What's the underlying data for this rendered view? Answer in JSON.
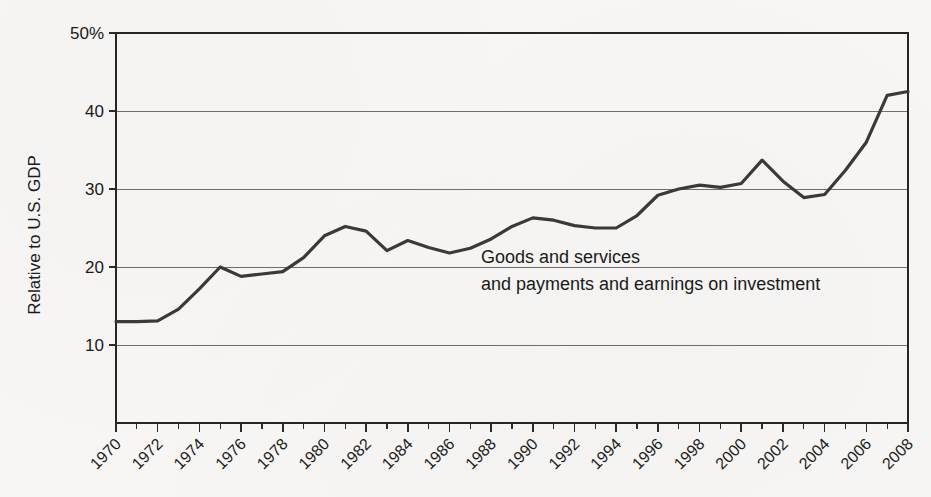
{
  "chart_data": {
    "type": "line",
    "title": "",
    "xlabel": "",
    "ylabel": "Relative to U.S. GDP",
    "ylim": [
      0,
      50
    ],
    "xlim": [
      1970,
      2008
    ],
    "y_tick_values": [
      50,
      40,
      30,
      20,
      10
    ],
    "y_tick_labels": [
      "50%",
      "40",
      "30",
      "20",
      "10"
    ],
    "x_tick_labels": [
      "1970",
      "1972",
      "1974",
      "1976",
      "1978",
      "1980",
      "1982",
      "1984",
      "1986",
      "1988",
      "1990",
      "1992",
      "1994",
      "1996",
      "1998",
      "2000",
      "2002",
      "2004",
      "2006",
      "2008"
    ],
    "x_tick_step_years": 2,
    "minor_tick_step_years": 1,
    "grid": "horizontal",
    "legend_position": "inline-annotation",
    "annotations": [
      {
        "name": "series-label",
        "lines": [
          "Goods and services",
          "and payments and earnings on investment"
        ],
        "x": 1994,
        "y": 23.0
      }
    ],
    "series": [
      {
        "name": "Goods and services and payments and earnings on investment",
        "color": "#3a3a3a",
        "x": [
          1970,
          1971,
          1972,
          1973,
          1974,
          1975,
          1976,
          1977,
          1978,
          1979,
          1980,
          1981,
          1982,
          1983,
          1984,
          1985,
          1986,
          1987,
          1988,
          1989,
          1990,
          1991,
          1992,
          1993,
          1994,
          1995,
          1996,
          1997,
          1998,
          1999,
          2000,
          2001,
          2002,
          2003,
          2004,
          2005,
          2006,
          2007,
          2008
        ],
        "values": [
          13.0,
          13.0,
          13.1,
          14.6,
          17.2,
          20.0,
          18.8,
          19.1,
          19.4,
          21.2,
          24.0,
          25.2,
          24.6,
          22.1,
          23.4,
          22.5,
          21.8,
          22.4,
          23.6,
          25.2,
          26.3,
          26.0,
          25.3,
          25.0,
          25.0,
          26.6,
          29.2,
          30.0,
          30.5,
          30.2,
          30.7,
          33.7,
          31.0,
          28.9,
          29.3,
          32.4,
          36.0,
          42.0,
          42.5
        ]
      }
    ]
  },
  "axes": {
    "y_axis_name": "relative-to-us-gdp-axis",
    "x_axis_name": "year-axis"
  }
}
